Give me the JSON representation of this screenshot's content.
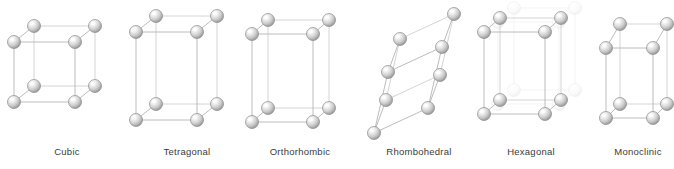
{
  "figure": {
    "background_color": "#ffffff",
    "width": 674,
    "height": 169
  },
  "style": {
    "edge_color": "#b4b4b4",
    "edge_color_back": "#cfcfcf",
    "sphere_fill_light": "#fdfdfd",
    "sphere_fill_mid": "#d2d2d2",
    "sphere_fill_dark": "#8e8e8e",
    "sphere_outline": "#8a8a8a",
    "ghost_color": "#efefef",
    "label_color": "#3b3b3b",
    "label_font_size": "9.5px"
  },
  "cells": [
    {
      "id": "cubic",
      "label": "Cubic",
      "label_x": 67,
      "label_y": 146,
      "atom_radius": 6.5,
      "edge_style": "solid",
      "ghost_layer": false,
      "vertices": {
        "front_bottom_left": [
          14,
          102
        ],
        "front_bottom_right": [
          75,
          102
        ],
        "front_top_left": [
          14,
          42
        ],
        "front_top_right": [
          75,
          42
        ],
        "back_bottom_left": [
          34,
          86
        ],
        "back_bottom_right": [
          95,
          86
        ],
        "back_top_left": [
          34,
          26
        ],
        "back_top_right": [
          95,
          26
        ]
      }
    },
    {
      "id": "tetragonal",
      "label": "Tetragonal",
      "label_x": 187,
      "label_y": 146,
      "atom_radius": 6.5,
      "edge_style": "solid",
      "ghost_layer": false,
      "vertices": {
        "front_bottom_left": [
          136,
          120
        ],
        "front_bottom_right": [
          197,
          120
        ],
        "front_top_left": [
          136,
          32
        ],
        "front_top_right": [
          197,
          32
        ],
        "back_bottom_left": [
          156,
          104
        ],
        "back_bottom_right": [
          217,
          104
        ],
        "back_top_left": [
          156,
          16
        ],
        "back_top_right": [
          217,
          16
        ]
      }
    },
    {
      "id": "orthorhombic",
      "label": "Orthorhombic",
      "label_x": 300,
      "label_y": 146,
      "atom_radius": 6.5,
      "edge_style": "solid",
      "ghost_layer": false,
      "vertices": {
        "front_bottom_left": [
          252,
          122
        ],
        "front_bottom_right": [
          313,
          122
        ],
        "front_top_left": [
          252,
          34
        ],
        "front_top_right": [
          313,
          34
        ],
        "back_bottom_left": [
          268,
          108
        ],
        "back_bottom_right": [
          329,
          108
        ],
        "back_top_left": [
          268,
          20
        ],
        "back_top_right": [
          329,
          20
        ]
      }
    },
    {
      "id": "rhombohedral",
      "label": "Rhombohedral",
      "label_x": 419,
      "label_y": 146,
      "atom_radius": 6.5,
      "edge_style": "solid",
      "ghost_layer": false,
      "vertices": {
        "front_bottom_left": [
          374,
          133
        ],
        "front_bottom_right": [
          428,
          108
        ],
        "front_top_left": [
          388,
          72
        ],
        "front_top_right": [
          442,
          47
        ],
        "back_bottom_left": [
          386,
          100
        ],
        "back_bottom_right": [
          440,
          75
        ],
        "back_top_left": [
          400,
          39
        ],
        "back_top_right": [
          454,
          14
        ]
      }
    },
    {
      "id": "hexagonal",
      "label": "Hexagonal",
      "label_x": 531,
      "label_y": 146,
      "atom_radius": 6.5,
      "edge_style": "solid",
      "ghost_layer": true,
      "vertices": {
        "front_bottom_left": [
          484,
          114
        ],
        "front_bottom_right": [
          545,
          114
        ],
        "front_top_left": [
          484,
          32
        ],
        "front_top_right": [
          545,
          32
        ],
        "back_bottom_left": [
          500,
          100
        ],
        "back_bottom_right": [
          561,
          100
        ],
        "back_top_left": [
          500,
          18
        ],
        "back_top_right": [
          561,
          18
        ]
      },
      "ghost_vertices": {
        "front_bottom_left": [
          498,
          104
        ],
        "front_bottom_right": [
          559,
          104
        ],
        "front_top_left": [
          498,
          22
        ],
        "front_top_right": [
          559,
          22
        ],
        "back_bottom_left": [
          514,
          90
        ],
        "back_bottom_right": [
          575,
          90
        ],
        "back_top_left": [
          514,
          8
        ],
        "back_top_right": [
          575,
          8
        ]
      }
    },
    {
      "id": "monoclinic",
      "label": "Monoclinic",
      "label_x": 638,
      "label_y": 146,
      "atom_radius": 6.5,
      "edge_style": "solid",
      "ghost_layer": false,
      "vertices": {
        "front_bottom_left": [
          606,
          118
        ],
        "front_bottom_right": [
          653,
          118
        ],
        "front_top_left": [
          606,
          48
        ],
        "front_top_right": [
          653,
          48
        ],
        "back_bottom_left": [
          620,
          104
        ],
        "back_bottom_right": [
          667,
          104
        ],
        "back_top_left": [
          620,
          24
        ],
        "back_top_right": [
          667,
          24
        ]
      }
    }
  ]
}
